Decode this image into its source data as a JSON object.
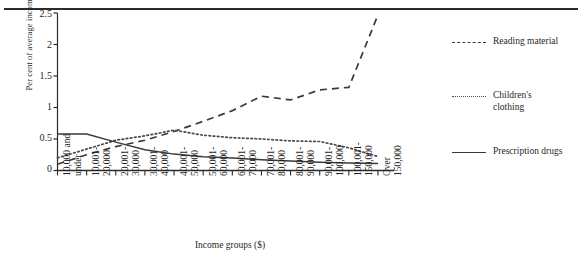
{
  "figure": {
    "has_top_rule": true,
    "background": "#ffffff",
    "ink": "#1f1f1f"
  },
  "chart_data": {
    "type": "line",
    "title": "",
    "xlabel": "Income groups ($)",
    "ylabel": "Per cent of average income",
    "ylim": [
      0,
      2.5
    ],
    "yticks": [
      0,
      0.5,
      1,
      1.5,
      2,
      2.5
    ],
    "ytick_labels": [
      "0",
      "0.5",
      "1",
      "1.5",
      "2",
      "2.5"
    ],
    "grid": false,
    "legend_position": "right",
    "categories": [
      "10,000 and under",
      "10,001-20,000",
      "20,001-30,000",
      "30,001-40,000",
      "40,001-50,000",
      "50,001-60,000",
      "60,001-70,000",
      "70,001-80,000",
      "80,001-90,000",
      "90,001-100,000",
      "100,001-150,000",
      "Over 150,000"
    ],
    "category_lines": [
      [
        "10,000 and",
        "under"
      ],
      [
        "10,001-",
        "20,000"
      ],
      [
        "20,001-",
        "30,000"
      ],
      [
        "30,001-",
        "40,000"
      ],
      [
        "40,001-",
        "50,000"
      ],
      [
        "50,001-",
        "60,000"
      ],
      [
        "60,001-",
        "70,000"
      ],
      [
        "70,001-",
        "80,000"
      ],
      [
        "80,001-",
        "90,000"
      ],
      [
        "90,001-",
        "100,000"
      ],
      [
        "100,001-",
        "150,000"
      ],
      [
        "Over",
        "150,000"
      ]
    ],
    "series": [
      {
        "name": "Reading material",
        "style": "dashed",
        "color": "#3a3a3a",
        "values": [
          0.1,
          0.25,
          0.38,
          0.48,
          0.62,
          0.78,
          0.95,
          1.18,
          1.12,
          1.28,
          1.32,
          2.47
        ]
      },
      {
        "name": "Children's clothing",
        "label_lines": [
          "Children's",
          "clothing"
        ],
        "style": "dotted",
        "color": "#4a4a4a",
        "values": [
          0.2,
          0.34,
          0.48,
          0.55,
          0.64,
          0.56,
          0.52,
          0.5,
          0.47,
          0.46,
          0.36,
          0.22
        ]
      },
      {
        "name": "Prescription drugs",
        "style": "solid",
        "color": "#3a3a3a",
        "values": [
          0.58,
          0.58,
          0.45,
          0.33,
          0.26,
          0.22,
          0.2,
          0.17,
          0.15,
          0.13,
          0.12,
          0.11
        ]
      }
    ]
  },
  "legend": {
    "items": [
      {
        "label": "Reading material",
        "style": "dashed"
      },
      {
        "label": "Children's\nclothing",
        "style": "dotted"
      },
      {
        "label": "Prescription drugs",
        "style": "solid"
      }
    ]
  }
}
